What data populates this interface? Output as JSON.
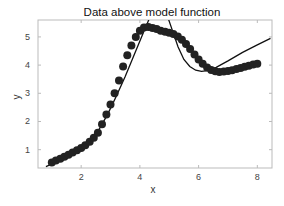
{
  "chart_data": {
    "type": "scatter",
    "title": "Data above model function",
    "xlabel": "x",
    "ylabel": "y",
    "xlim": [
      0.53,
      8.5
    ],
    "ylim": [
      0.35,
      5.6
    ],
    "xticks": [
      2,
      4,
      6,
      8
    ],
    "yticks": [
      1,
      2,
      3,
      4,
      5
    ],
    "grid": false,
    "legend": "none",
    "series": [
      {
        "name": "data",
        "kind": "points",
        "color": "#222222",
        "x": [
          1.0,
          1.14,
          1.29,
          1.43,
          1.57,
          1.71,
          1.86,
          2.0,
          2.14,
          2.29,
          2.43,
          2.57,
          2.71,
          2.86,
          3.0,
          3.14,
          3.29,
          3.43,
          3.57,
          3.71,
          3.86,
          4.0,
          4.14,
          4.29,
          4.43,
          4.57,
          4.71,
          4.86,
          5.0,
          5.14,
          5.29,
          5.43,
          5.57,
          5.71,
          5.86,
          6.0,
          6.14,
          6.29,
          6.43,
          6.57,
          6.71,
          6.86,
          7.0,
          7.14,
          7.29,
          7.43,
          7.57,
          7.71,
          7.86,
          8.0
        ],
        "y": [
          0.55,
          0.62,
          0.68,
          0.75,
          0.82,
          0.9,
          0.98,
          1.06,
          1.16,
          1.28,
          1.42,
          1.6,
          1.9,
          2.25,
          2.6,
          3.0,
          3.45,
          3.95,
          4.35,
          4.7,
          5.0,
          5.22,
          5.33,
          5.35,
          5.32,
          5.28,
          5.22,
          5.18,
          5.15,
          5.1,
          5.02,
          4.9,
          4.75,
          4.57,
          4.38,
          4.2,
          4.05,
          3.92,
          3.83,
          3.78,
          3.76,
          3.77,
          3.79,
          3.82,
          3.86,
          3.9,
          3.94,
          3.98,
          4.02,
          4.05
        ]
      },
      {
        "name": "model",
        "kind": "line",
        "color": "#111111",
        "x": [
          0.8,
          1.2,
          1.6,
          2.0,
          2.3,
          2.6,
          2.9,
          3.2,
          3.5,
          3.8,
          4.1,
          4.3,
          4.5,
          4.65,
          4.8,
          4.95,
          5.1,
          5.3,
          5.5,
          5.7,
          5.9,
          6.1,
          6.3,
          6.6,
          7.0,
          7.5,
          8.0,
          8.45
        ],
        "y": [
          0.4,
          0.58,
          0.8,
          1.05,
          1.3,
          1.7,
          2.25,
          2.9,
          3.6,
          4.35,
          5.1,
          5.6,
          6.0,
          6.1,
          6.0,
          5.7,
          5.25,
          4.65,
          4.2,
          3.95,
          3.82,
          3.78,
          3.8,
          3.92,
          4.15,
          4.45,
          4.72,
          4.95
        ]
      }
    ]
  }
}
